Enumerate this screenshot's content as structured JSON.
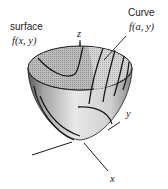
{
  "figure": {
    "type": "3d-surface-diagram"
  },
  "labels": {
    "surface": {
      "title": "surface",
      "formula": "f(x, y)"
    },
    "curve": {
      "title": "Curve",
      "formula": "f(a, y)"
    },
    "axes": {
      "x": "x",
      "y": "y",
      "z": "z"
    }
  },
  "colors": {
    "line": "#1a1a1a",
    "inner_shade": "#a8a8a8",
    "inner_light": "#c9c9c9",
    "outer_light": "#e6e6e6",
    "outer_shade": "#8c8c8c"
  }
}
